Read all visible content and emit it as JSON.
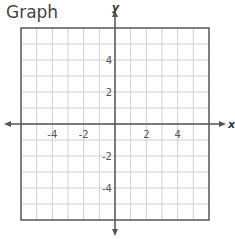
{
  "title": "Graph",
  "graph": {
    "x_axis_label": "x",
    "y_axis_label": "y",
    "x_range": [
      -6,
      6
    ],
    "y_range": [
      -6,
      6
    ],
    "grid_step": 1,
    "x_ticks": [
      {
        "value": -4,
        "label": "-4"
      },
      {
        "value": -2,
        "label": "-2"
      },
      {
        "value": 2,
        "label": "2"
      },
      {
        "value": 4,
        "label": "4"
      }
    ],
    "y_ticks": [
      {
        "value": 4,
        "label": "4"
      },
      {
        "value": 2,
        "label": "2"
      },
      {
        "value": -2,
        "label": "-2"
      },
      {
        "value": -4,
        "label": "-4"
      }
    ],
    "colors": {
      "grid": "#d0d0d0",
      "border": "#555555",
      "axis": "#555555"
    }
  }
}
